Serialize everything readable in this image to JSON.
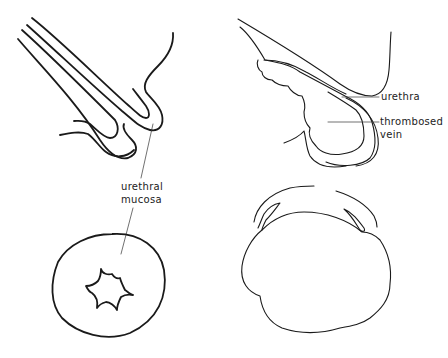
{
  "figure": {
    "panels": [
      {
        "id": "top-left",
        "description": "longitudinal section, normal urethral mucosa prolapse fold"
      },
      {
        "id": "top-right",
        "description": "longitudinal section, prolapse with thrombosed vein"
      },
      {
        "id": "bottom-left",
        "description": "frontal view, prolapsed urethral mucosa ring with stellate lumen"
      },
      {
        "id": "bottom-right",
        "description": "frontal view, thrombosed lobulated prolapse"
      }
    ],
    "labels": {
      "urethral_mucosa_line1": "urethral",
      "urethral_mucosa_line2": "mucosa",
      "urethra": "urethra",
      "thrombosed_vein_line1": "thrombosed",
      "thrombosed_vein_line2": "vein"
    }
  }
}
